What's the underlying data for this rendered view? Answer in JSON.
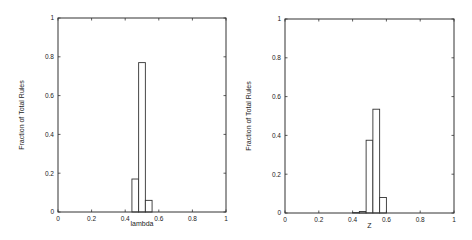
{
  "chart_data": [
    {
      "type": "bar",
      "title": "",
      "xlabel": "lambda",
      "ylabel": "Fraction of Total Rules",
      "xlim": [
        0,
        1
      ],
      "ylim": [
        0,
        1
      ],
      "xticks": [
        "0",
        "0.2",
        "0.4",
        "0.6",
        "0.8",
        "1"
      ],
      "yticks": [
        "0",
        "0.2",
        "0.4",
        "0.6",
        "0.8",
        "1"
      ],
      "grid": false,
      "bins": [
        {
          "x0": 0.44,
          "x1": 0.48,
          "value": 0.17
        },
        {
          "x0": 0.48,
          "x1": 0.52,
          "value": 0.77
        },
        {
          "x0": 0.52,
          "x1": 0.56,
          "value": 0.06
        }
      ]
    },
    {
      "type": "bar",
      "title": "",
      "xlabel": "Z",
      "ylabel": "Fraction of Total Rules",
      "xlim": [
        0,
        1
      ],
      "ylim": [
        0,
        1
      ],
      "xticks": [
        "0",
        "0.2",
        "0.4",
        "0.6",
        "0.8",
        "1"
      ],
      "yticks": [
        "0",
        "0.2",
        "0.4",
        "0.6",
        "0.8",
        "1"
      ],
      "grid": false,
      "bins": [
        {
          "x0": 0.4,
          "x1": 0.44,
          "value": 0.002
        },
        {
          "x0": 0.44,
          "x1": 0.48,
          "value": 0.008
        },
        {
          "x0": 0.48,
          "x1": 0.52,
          "value": 0.375
        },
        {
          "x0": 0.52,
          "x1": 0.56,
          "value": 0.535
        },
        {
          "x0": 0.56,
          "x1": 0.6,
          "value": 0.08
        }
      ]
    }
  ]
}
